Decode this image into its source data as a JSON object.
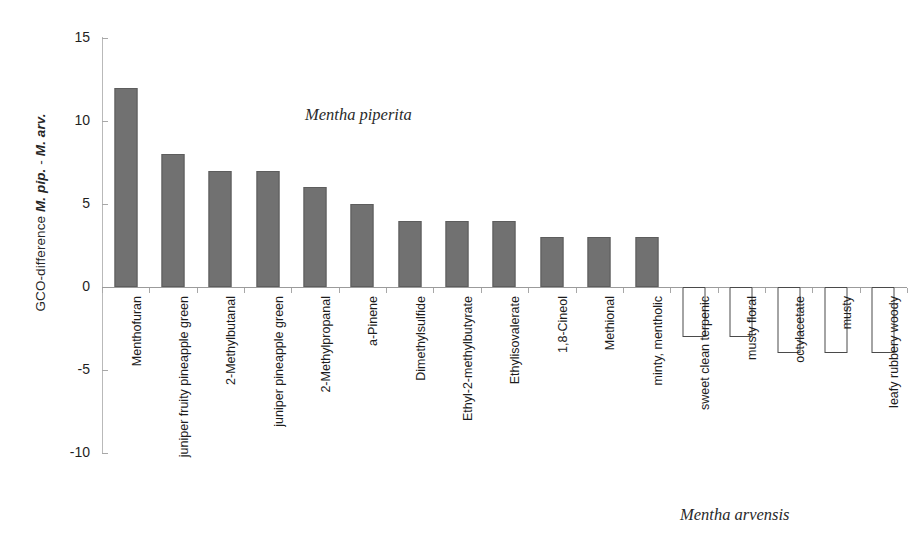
{
  "chart_data": {
    "type": "bar",
    "title": "",
    "xlabel": "",
    "ylabel": "GCO-difference M. pip. - M. arv.",
    "ylabel_parts": {
      "prefix": "GCO-difference ",
      "sci1": "M. pip.",
      "middle": " - ",
      "sci2": "M. arv."
    },
    "ylim": [
      -10,
      15
    ],
    "yticks": [
      15,
      10,
      5,
      0,
      -5,
      -10
    ],
    "ytick_labels": [
      "15",
      "10",
      "5",
      "0",
      "-5",
      "-10"
    ],
    "grid": false,
    "legend": null,
    "categories": [
      "Menthofuran",
      "juniper fruity pineapple green",
      "2-Methylbutanal",
      "juniper pineapple green",
      "2-Methylpropanal",
      "a-Pinene",
      "Dimethylsulfide",
      "Ethyl-2-methylbutyrate",
      "Ethylisovalerate",
      "1,8-Cineol",
      "Methional",
      "minty, mentholic",
      "sweet clean terpenic",
      "musty floral",
      "octylacetate",
      "musty",
      "leafy rubbery woody"
    ],
    "values": [
      12,
      8,
      7,
      7,
      6,
      5,
      4,
      4,
      4,
      3,
      3,
      3,
      -3,
      -3,
      -4,
      -4,
      -4
    ],
    "bar_styles": [
      "filled",
      "filled",
      "filled",
      "filled",
      "filled",
      "filled",
      "filled",
      "filled",
      "filled",
      "filled",
      "filled",
      "filled",
      "outline",
      "outline",
      "outline",
      "outline",
      "outline"
    ],
    "annotations": [
      {
        "text": "Mentha piperita",
        "style": "italic-serif",
        "position": "upper-center-left"
      },
      {
        "text": "Mentha arvensis",
        "style": "italic-serif",
        "position": "lower-right"
      }
    ],
    "colors": {
      "bar_fill_positive": "#717171",
      "bar_stroke_positive": "#5d5d5d",
      "bar_fill_negative": "#ffffff",
      "bar_stroke_negative": "#4a4a4a",
      "axis": "#9b9b9b",
      "text": "#1c1c1c",
      "background": "#ffffff"
    }
  },
  "annotations": {
    "piperita": "Mentha piperita",
    "arvensis": "Mentha arvensis"
  }
}
